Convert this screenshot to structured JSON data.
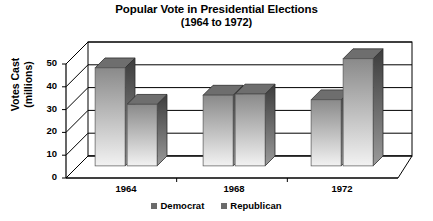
{
  "chart_data": {
    "type": "bar",
    "title": "Popular Vote in Presidential Elections",
    "subtitle": "(1964 to 1972)",
    "xlabel": "",
    "ylabel": "Votes Cast\n(millions)",
    "ylabel_line1": "Votes Cast",
    "ylabel_line2": "(millions)",
    "categories": [
      "1964",
      "1968",
      "1972"
    ],
    "series": [
      {
        "name": "Democrat",
        "values": [
          43,
          31,
          29
        ],
        "color": "#8c8c8c"
      },
      {
        "name": "Republican",
        "values": [
          27,
          31.5,
          47
        ],
        "color": "#8c8c8c"
      }
    ],
    "ylim": [
      0,
      50
    ],
    "yticks": [
      0,
      10,
      20,
      30,
      40,
      50
    ],
    "ytick_labels": [
      "0",
      "10",
      "20",
      "30",
      "40",
      "50"
    ],
    "grid": true,
    "legend_position": "bottom",
    "style": "3d-column",
    "legend_entries": [
      "Democrat",
      "Republican"
    ]
  },
  "colors": {
    "bar_top": "#8a8a8a",
    "bar_bottom": "#f2f2f2",
    "bar_side": "#4a4a4a",
    "bar_cap": "#6e6e6e",
    "axis": "#000000",
    "grid": "#000000",
    "background": "#ffffff",
    "legend_swatch": "#6b6b6b"
  }
}
